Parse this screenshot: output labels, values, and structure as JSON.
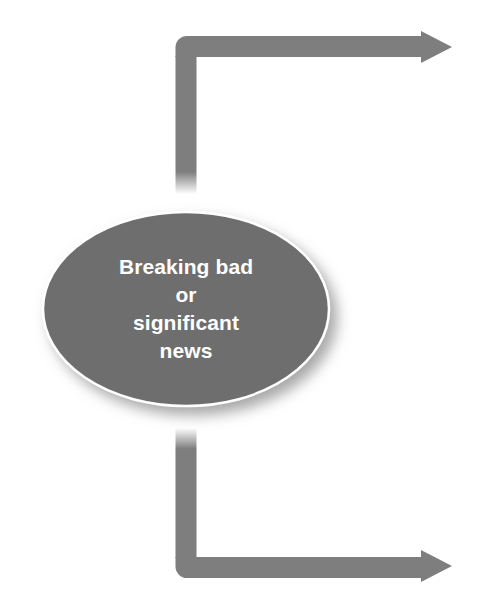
{
  "diagram": {
    "type": "flowchart",
    "background_color": "#ffffff",
    "width": 498,
    "height": 605,
    "node": {
      "id": "breaking-news-node",
      "shape": "ellipse",
      "fill_color": "#6e6e6e",
      "stroke_color": "#ffffff",
      "text_color": "#ffffff",
      "center_x": 186,
      "center_y": 309,
      "radius_x": 143,
      "radius_y": 97,
      "lines": [
        "Breaking bad",
        "or",
        "significant",
        "news"
      ],
      "full_text": "Breaking bad or significant news"
    },
    "connectors": [
      {
        "id": "top-elbow-arrow",
        "label": "",
        "color": "#7e7e7e",
        "stroke_width": 21,
        "direction": "up-then-right",
        "arrowhead": "right",
        "start_x": 186,
        "start_y": 192,
        "corner_x": 186,
        "corner_y": 47,
        "end_x": 452,
        "end_y": 47
      },
      {
        "id": "bottom-elbow-arrow",
        "label": "",
        "color": "#7e7e7e",
        "stroke_width": 21,
        "direction": "down-then-right",
        "arrowhead": "right",
        "start_x": 186,
        "start_y": 428,
        "corner_x": 186,
        "corner_y": 566,
        "end_x": 452,
        "end_y": 566
      }
    ]
  }
}
